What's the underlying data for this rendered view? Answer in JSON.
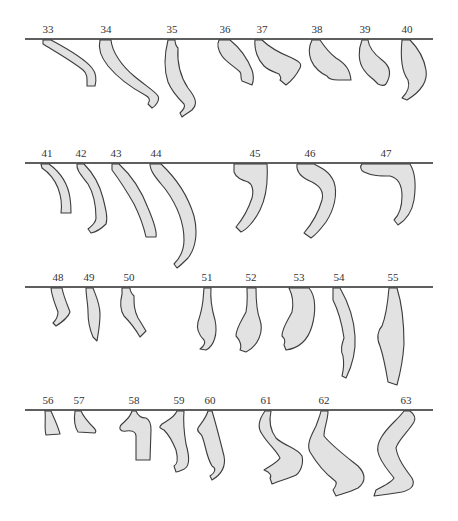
{
  "figure": {
    "type": "specimen-profile-catalog",
    "colors": {
      "fill": "#e2e2e2",
      "outline": "#3c3c3c",
      "baseline": "#2a2a2a",
      "label": "#333333"
    },
    "rows": [
      {
        "baseline_y": 39,
        "specimens": [
          {
            "label": "33",
            "x": 48,
            "path": "M43,40 L51,40 C66,48 84,58 92,68 C97,74 96,82 95,86 L87,86 C87,80 88,74 83,70 C72,61 56,52 43,44 Z"
          },
          {
            "label": "34",
            "x": 105,
            "path": "M100,40 L111,40 C112,52 122,66 134,76 C146,86 156,92 158,96 C160,100 156,106 152,108 L148,104 C151,100 149,97 145,95 C132,88 118,78 108,66 C100,56 98,48 100,40 Z"
          },
          {
            "label": "35",
            "x": 172,
            "path": "M168,40 L175,40 C175,44 176,46 178,48 C177,62 180,76 188,88 C196,98 198,104 192,110 C188,113 184,115 182,117 L180,113 C183,110 186,107 184,104 C178,98 172,92 168,82 C164,70 164,56 168,40 Z"
          }
        ]
      }
    ]
  },
  "labels": {
    "row1": [
      "33",
      "34",
      "35",
      "36",
      "37",
      "38",
      "39",
      "40"
    ],
    "row2": [
      "41",
      "42",
      "43",
      "44",
      "45",
      "46",
      "47"
    ],
    "row3": [
      "48",
      "49",
      "50",
      "51",
      "52",
      "53",
      "54",
      "55"
    ],
    "row4": [
      "56",
      "57",
      "58",
      "59",
      "60",
      "61",
      "62",
      "63"
    ]
  }
}
